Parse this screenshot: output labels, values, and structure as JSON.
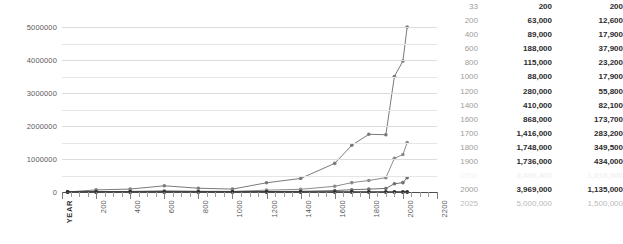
{
  "chart_data": {
    "type": "line",
    "title": "",
    "xlabel": "YEAR",
    "ylabel": "",
    "xlim": [
      0,
      2200
    ],
    "ylim": [
      0,
      5000000
    ],
    "grid": true,
    "legend": "none",
    "y_ticks": [
      "0",
      "1000000",
      "2000000",
      "3000000",
      "4000000",
      "5000000"
    ],
    "y_tick_values": [
      0,
      1000000,
      2000000,
      3000000,
      4000000,
      5000000
    ],
    "y_minor_step": 500000,
    "x_ticks": [
      "YEAR",
      "200",
      "400",
      "600",
      "800",
      "1000",
      "1200",
      "1400",
      "1600",
      "1800",
      "2000",
      "2200"
    ],
    "x_tick_values": [
      0,
      200,
      400,
      600,
      800,
      1000,
      1200,
      1400,
      1600,
      1800,
      2000,
      2200
    ],
    "x": [
      33,
      200,
      400,
      600,
      800,
      1000,
      1200,
      1400,
      1600,
      1700,
      1800,
      1900,
      1950,
      2000,
      2025
    ],
    "series": [
      {
        "name": "series-a",
        "color": "#7a7a7a",
        "values": [
          200,
          63000,
          89000,
          188000,
          115000,
          88000,
          280000,
          410000,
          868000,
          1416000,
          1748000,
          1736000,
          3499400,
          3969000,
          5000000
        ]
      },
      {
        "name": "series-b",
        "color": "#8c8c8c",
        "values": [
          200,
          12600,
          17900,
          37900,
          23200,
          17900,
          55800,
          82100,
          173700,
          283200,
          349500,
          434000,
          1019000,
          1135000,
          1500000
        ]
      },
      {
        "name": "series-c",
        "color": "#6e6e6e",
        "values": [
          200,
          3000,
          4500,
          9000,
          6000,
          4500,
          14000,
          20000,
          43000,
          70000,
          87000,
          108000,
          250000,
          283000,
          430000
        ]
      },
      {
        "name": "baseline",
        "color": "#2f2f2f",
        "values": [
          0,
          0,
          0,
          0,
          0,
          0,
          0,
          0,
          0,
          0,
          0,
          0,
          0,
          0,
          0
        ]
      }
    ]
  },
  "table": {
    "columns": [
      "year",
      "value_a",
      "value_b"
    ],
    "rows": [
      {
        "year": "33",
        "a": "200",
        "b": "200",
        "style": "normal"
      },
      {
        "year": "200",
        "a": "63,000",
        "b": "12,600",
        "style": "normal"
      },
      {
        "year": "400",
        "a": "89,000",
        "b": "17,900",
        "style": "normal"
      },
      {
        "year": "600",
        "a": "188,000",
        "b": "37,900",
        "style": "normal"
      },
      {
        "year": "800",
        "a": "115,000",
        "b": "23,200",
        "style": "normal"
      },
      {
        "year": "1000",
        "a": "88,000",
        "b": "17,900",
        "style": "normal"
      },
      {
        "year": "1200",
        "a": "280,000",
        "b": "55,800",
        "style": "normal"
      },
      {
        "year": "1400",
        "a": "410,000",
        "b": "82,100",
        "style": "normal"
      },
      {
        "year": "1600",
        "a": "868,000",
        "b": "173,700",
        "style": "normal"
      },
      {
        "year": "1700",
        "a": "1,416,000",
        "b": "283,200",
        "style": "normal"
      },
      {
        "year": "1800",
        "a": "1,748,000",
        "b": "349,500",
        "style": "normal"
      },
      {
        "year": "1900",
        "a": "1,736,000",
        "b": "434,000",
        "style": "normal"
      },
      {
        "year": "1950",
        "a": "3,499,400",
        "b": "1,019,000",
        "style": "faded"
      },
      {
        "year": "2000",
        "a": "3,969,000",
        "b": "1,135,000",
        "style": "normal"
      },
      {
        "year": "2025",
        "a": "5,000,000",
        "b": "1,500,000",
        "style": "light"
      }
    ]
  }
}
